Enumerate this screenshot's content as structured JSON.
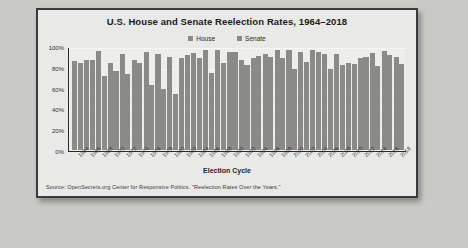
{
  "chart_data": {
    "type": "bar",
    "title": "U.S. House and Senate Reelection Rates, 1964–2018",
    "xlabel": "Election Cycle",
    "ylabel": "",
    "ylim": [
      0,
      100
    ],
    "ytick_labels": [
      "100%",
      "80%",
      "60%",
      "40%",
      "20%",
      "0%"
    ],
    "ytick_values": [
      100,
      80,
      60,
      40,
      20,
      0
    ],
    "grid": true,
    "legend_position": "top-center",
    "categories": [
      "1964",
      "1966",
      "1968",
      "1970",
      "1972",
      "1974",
      "1976",
      "1978",
      "1980",
      "1982",
      "1984",
      "1986",
      "1988",
      "1990",
      "1992",
      "1994",
      "1996",
      "1998",
      "2000",
      "2002",
      "2004",
      "2006",
      "2008",
      "2010",
      "2012",
      "2014",
      "2016",
      "2018"
    ],
    "series": [
      {
        "name": "House",
        "color": "#8a8a88",
        "values": [
          87,
          88,
          97,
          85,
          94,
          88,
          96,
          94,
          91,
          90,
          95,
          98,
          98,
          96,
          88,
          90,
          94,
          98,
          98,
          96,
          98,
          94,
          94,
          85,
          90,
          95,
          97,
          91
        ]
      },
      {
        "name": "Senate",
        "color": "#8a8a88",
        "values": [
          85,
          88,
          72,
          77,
          74,
          85,
          64,
          60,
          55,
          93,
          90,
          75,
          85,
          96,
          83,
          92,
          91,
          90,
          79,
          86,
          96,
          79,
          83,
          84,
          91,
          82,
          93,
          84
        ]
      }
    ],
    "source_note": "Source: OpenSecrets.org Center for Responsive Politics. \"Reelection Rates Over the Years.\""
  },
  "legend": {
    "entries": [
      {
        "label": "House",
        "color": "#8a8a88"
      },
      {
        "label": "Senate",
        "color": "#8a8a88"
      }
    ]
  }
}
